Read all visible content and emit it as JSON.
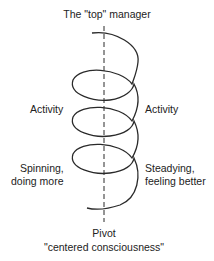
{
  "diagram": {
    "title": "The \"top\" manager",
    "left_labels": {
      "activity": "Activity",
      "spinning_line1": "Spinning,",
      "spinning_line2": "doing more"
    },
    "right_labels": {
      "activity": "Activity",
      "steadying_line1": "Steadying,",
      "steadying_line2": "feeling better"
    },
    "bottom": {
      "line1": "Pivot",
      "line2": "\"centered consciousness\""
    },
    "colors": {
      "stroke": "#2a2a2a",
      "text": "#222222"
    }
  }
}
